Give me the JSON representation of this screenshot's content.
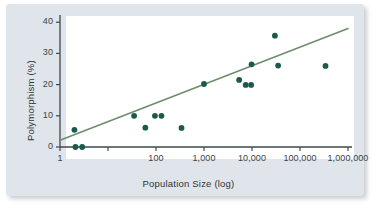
{
  "chart_data": {
    "type": "scatter",
    "title": "",
    "xlabel": "Population Size (log)",
    "ylabel": "Polymorphism (%)",
    "xscale": "log",
    "yscale": "linear",
    "xlim": [
      1,
      1000000
    ],
    "ylim": [
      0,
      42
    ],
    "grid": false,
    "legend": null,
    "xticks": [
      {
        "value": 1,
        "label": "1"
      },
      {
        "value": 10,
        "label": ""
      },
      {
        "value": 100,
        "label": "100"
      },
      {
        "value": 1000,
        "label": "1,000"
      },
      {
        "value": 10000,
        "label": "10,000"
      },
      {
        "value": 100000,
        "label": "100,000"
      },
      {
        "value": 1000000,
        "label": "1,000,000"
      }
    ],
    "yticks": [
      {
        "value": 0,
        "label": "0"
      },
      {
        "value": 10,
        "label": "10"
      },
      {
        "value": 20,
        "label": "20"
      },
      {
        "value": 30,
        "label": "30"
      },
      {
        "value": 40,
        "label": "40"
      }
    ],
    "points": [
      {
        "x": 2,
        "y": 5.5
      },
      {
        "x": 2.1,
        "y": 0
      },
      {
        "x": 2.9,
        "y": 0
      },
      {
        "x": 35,
        "y": 10
      },
      {
        "x": 60,
        "y": 6.2
      },
      {
        "x": 95,
        "y": 10
      },
      {
        "x": 130,
        "y": 10
      },
      {
        "x": 340,
        "y": 6.1
      },
      {
        "x": 1000,
        "y": 20.2
      },
      {
        "x": 5400,
        "y": 21.5
      },
      {
        "x": 7400,
        "y": 19.9
      },
      {
        "x": 9600,
        "y": 19.9
      },
      {
        "x": 9800,
        "y": 26.5
      },
      {
        "x": 30000,
        "y": 35.7
      },
      {
        "x": 35000,
        "y": 26.1
      },
      {
        "x": 340000,
        "y": 26.0
      }
    ],
    "trendline": {
      "x_start": 1,
      "y_start": 2.2,
      "x_end": 1000000,
      "y_end": 38.0
    },
    "colors": {
      "point_fill": "#1b5a4b",
      "trendline": "#6c8f6b",
      "axis": "#3f484d",
      "panel_background": "#dfe5ea",
      "plot_background": "#ffffff",
      "text": "#2f3438"
    }
  }
}
